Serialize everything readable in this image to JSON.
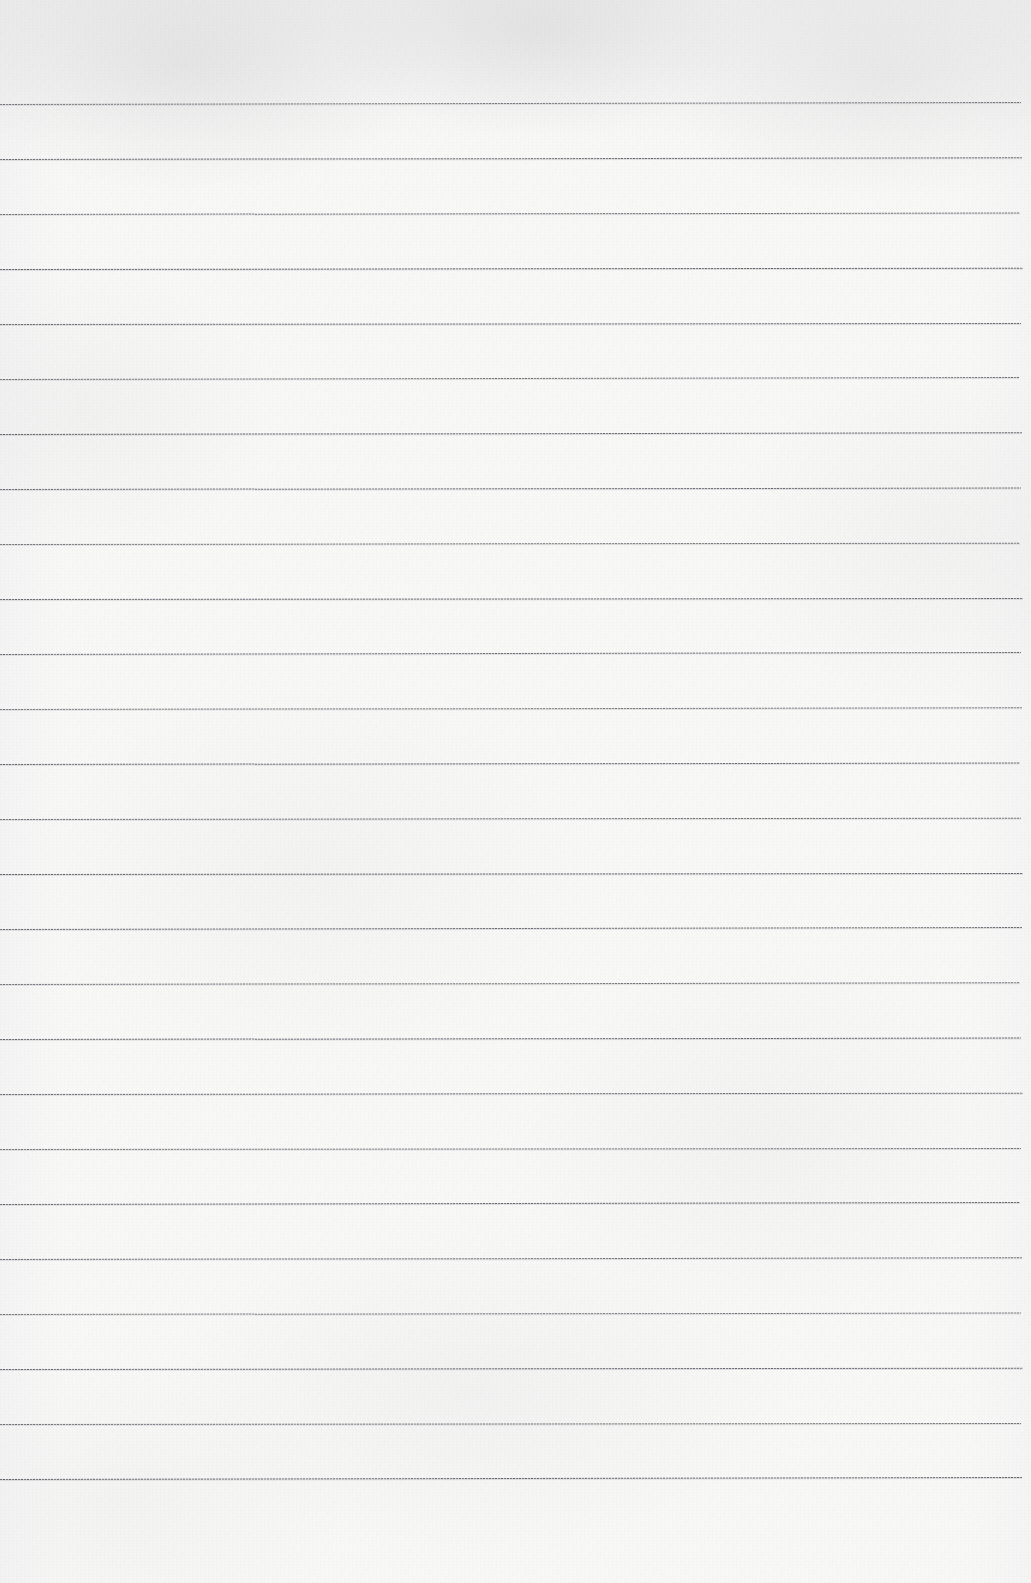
{
  "document": {
    "kind": "scanned-blank-lined-paper",
    "title": "Blank Lined Notebook Page",
    "text_content": "",
    "handwriting": "",
    "printed_text": "",
    "page_number": "",
    "header": "",
    "footer": "",
    "margin_rule": "none",
    "holes": "none"
  },
  "canvas": {
    "width": 1031,
    "height": 1583,
    "paper_color": "#f8f8f7",
    "edge_shadow_color": "#e4e4e6"
  },
  "ruling": {
    "line_color": "#5c5e64",
    "line_thickness_px": 1,
    "line_count": 26,
    "first_line_y": 104,
    "spacing_px": 55.05,
    "left_x": 0,
    "right_x": 1023,
    "slope_px_across_page": -1.5,
    "lines": [
      {
        "index": 1,
        "y": 104,
        "x_start": 0,
        "x_end": 1021
      },
      {
        "index": 2,
        "y": 159,
        "x_start": 0,
        "x_end": 1022
      },
      {
        "index": 3,
        "y": 214,
        "x_start": 0,
        "x_end": 1020
      },
      {
        "index": 4,
        "y": 269,
        "x_start": 0,
        "x_end": 1023
      },
      {
        "index": 5,
        "y": 324,
        "x_start": 0,
        "x_end": 1021
      },
      {
        "index": 6,
        "y": 379,
        "x_start": 0,
        "x_end": 1019
      },
      {
        "index": 7,
        "y": 434,
        "x_start": 0,
        "x_end": 1022
      },
      {
        "index": 8,
        "y": 489,
        "x_start": 0,
        "x_end": 1021
      },
      {
        "index": 9,
        "y": 544,
        "x_start": 0,
        "x_end": 1020
      },
      {
        "index": 10,
        "y": 599,
        "x_start": 0,
        "x_end": 1023
      },
      {
        "index": 11,
        "y": 654,
        "x_start": 0,
        "x_end": 1021
      },
      {
        "index": 12,
        "y": 709,
        "x_start": 0,
        "x_end": 1022
      },
      {
        "index": 13,
        "y": 764,
        "x_start": 0,
        "x_end": 1020
      },
      {
        "index": 14,
        "y": 819,
        "x_start": 0,
        "x_end": 1021
      },
      {
        "index": 15,
        "y": 874,
        "x_start": 0,
        "x_end": 1023
      },
      {
        "index": 16,
        "y": 929,
        "x_start": 0,
        "x_end": 1022
      },
      {
        "index": 17,
        "y": 984,
        "x_start": 0,
        "x_end": 1020
      },
      {
        "index": 18,
        "y": 1039,
        "x_start": 0,
        "x_end": 1021
      },
      {
        "index": 19,
        "y": 1094,
        "x_start": 0,
        "x_end": 1023
      },
      {
        "index": 20,
        "y": 1149,
        "x_start": 0,
        "x_end": 1021
      },
      {
        "index": 21,
        "y": 1204,
        "x_start": 0,
        "x_end": 1020
      },
      {
        "index": 22,
        "y": 1259,
        "x_start": 0,
        "x_end": 1022
      },
      {
        "index": 23,
        "y": 1314,
        "x_start": 0,
        "x_end": 1021
      },
      {
        "index": 24,
        "y": 1369,
        "x_start": 0,
        "x_end": 1023
      },
      {
        "index": 25,
        "y": 1424,
        "x_start": 0,
        "x_end": 1021
      },
      {
        "index": 26,
        "y": 1479,
        "x_start": 0,
        "x_end": 1022
      }
    ]
  },
  "margins": {
    "top_blank_px": 104,
    "bottom_blank_px": 104
  }
}
